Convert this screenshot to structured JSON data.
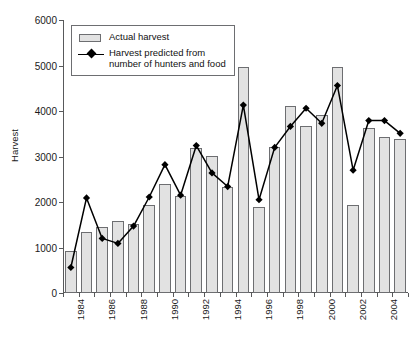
{
  "chart_data": {
    "type": "bar",
    "title": "",
    "subtitle": "",
    "xlabel": "",
    "ylabel": "Harvest",
    "ylim": [
      0,
      6000
    ],
    "ytick_step": 1000,
    "yticks": [
      "0",
      "1000",
      "2000",
      "3000",
      "4000",
      "5000",
      "6000"
    ],
    "grid": false,
    "legend_position": "top-left",
    "x": [
      1984,
      1985,
      1986,
      1987,
      1988,
      1989,
      1990,
      1991,
      1992,
      1993,
      1994,
      1995,
      1996,
      1997,
      1998,
      1999,
      2000,
      2001,
      2002,
      2003,
      2004,
      2005
    ],
    "categories": [
      "1984",
      "1985",
      "1986",
      "1987",
      "1988",
      "1989",
      "1990",
      "1991",
      "1992",
      "1993",
      "1994",
      "1995",
      "1996",
      "1997",
      "1998",
      "1999",
      "2000",
      "2001",
      "2002",
      "2003",
      "2004",
      "2005"
    ],
    "xtick_labels_shown": [
      "1984",
      "1986",
      "1988",
      "1990",
      "1992",
      "1994",
      "1996",
      "1998",
      "2000",
      "2002",
      "2004"
    ],
    "xtick_label_interval": 2,
    "series": [
      {
        "name": "Actual harvest",
        "kind": "bar",
        "color": "#e2e2e2",
        "edge_color": "#6d6e71",
        "values": [
          920,
          1340,
          1440,
          1580,
          1510,
          1940,
          2400,
          2140,
          3180,
          3020,
          2340,
          4970,
          1890,
          3200,
          4120,
          3660,
          3910,
          4960,
          1940,
          3630,
          3420,
          3380
        ]
      },
      {
        "name": "Harvest predicted from number of hunters and food",
        "kind": "line",
        "color": "#000000",
        "marker": "diamond",
        "values": [
          560,
          2090,
          1200,
          1090,
          1470,
          2110,
          2820,
          2150,
          3240,
          2640,
          2340,
          4130,
          2050,
          3200,
          3660,
          4060,
          3730,
          4560,
          2700,
          3790,
          3790,
          3510
        ]
      }
    ]
  },
  "legend": {
    "items": [
      {
        "label": "Actual harvest",
        "key": "bar-swatch"
      },
      {
        "label": "Harvest predicted from\nnumber of hunters and food",
        "key": "line-marker"
      }
    ]
  },
  "axes": {
    "y_title": "Harvest"
  }
}
